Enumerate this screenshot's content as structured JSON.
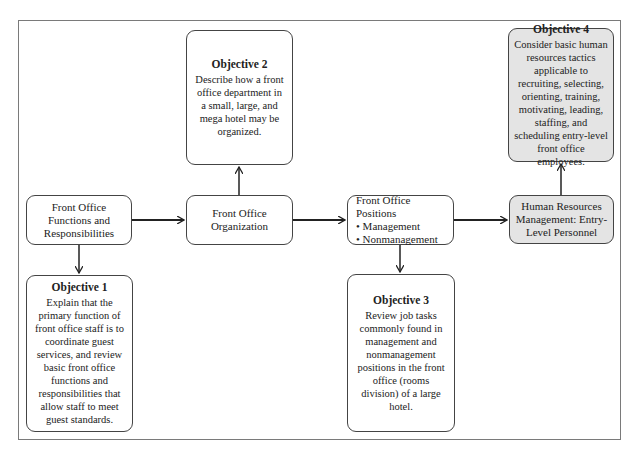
{
  "diagram": {
    "nodes": {
      "functions": {
        "label": "Front Office Functions and Responsibilities"
      },
      "organization": {
        "label": "Front Office Organization"
      },
      "positions": {
        "label": "Front Office Positions",
        "bullets": [
          "Management",
          "Nonmanagement"
        ],
        "bullet_char": "•"
      },
      "hr": {
        "label": "Human Resources Management: Entry-Level Personnel"
      }
    },
    "objectives": {
      "obj1": {
        "title": "Objective 1",
        "text": "Explain that the primary function of front office staff is to coordinate guest services, and review basic front office functions and responsibilities that allow staff to meet guest standards."
      },
      "obj2": {
        "title": "Objective 2",
        "text": "Describe how a front office department in a small, large, and mega hotel may be organized."
      },
      "obj3": {
        "title": "Objective 3",
        "text": "Review job tasks commonly found in management and nonmanagement positions in the front office (rooms division) of a large hotel."
      },
      "obj4": {
        "title": "Objective 4",
        "text": "Consider basic human resources tactics applicable to recruiting, selecting, orienting, training, motivating, leading, staffing, and scheduling entry-level front office employees."
      }
    },
    "colors": {
      "border": "#444444",
      "frame": "#7a7a7a",
      "shaded_fill": "#e4e4e4",
      "arrow": "#222222"
    }
  }
}
